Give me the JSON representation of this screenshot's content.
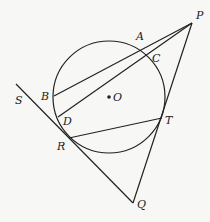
{
  "figure": {
    "circle": {
      "center": "O",
      "cx": 109,
      "cy": 97,
      "r": 56
    },
    "points": {
      "P": {
        "label": "P",
        "x": 192,
        "y": 23,
        "lx": 196,
        "ly": 19
      },
      "A": {
        "label": "A",
        "x": 140,
        "y": 46,
        "lx": 136,
        "ly": 40
      },
      "C": {
        "label": "C",
        "x": 148,
        "y": 55,
        "lx": 152,
        "ly": 62
      },
      "B": {
        "label": "B",
        "x": 54,
        "y": 96,
        "lx": 41,
        "ly": 100
      },
      "D": {
        "label": "D",
        "x": 58,
        "y": 117,
        "lx": 63,
        "ly": 125
      },
      "O": {
        "label": "O",
        "x": 109,
        "y": 97,
        "lx": 113,
        "ly": 101
      },
      "R": {
        "label": "R",
        "x": 69,
        "y": 138,
        "lx": 57,
        "ly": 150
      },
      "T": {
        "label": "T",
        "x": 162,
        "y": 118,
        "lx": 165,
        "ly": 124
      },
      "Q": {
        "label": "Q",
        "x": 133,
        "y": 203,
        "lx": 137,
        "ly": 208
      },
      "S": {
        "label": "S",
        "x": 16,
        "y": 84,
        "lx": 15,
        "ly": 104
      }
    },
    "segments": [
      {
        "from": "P",
        "to": "B",
        "name": "secant-PAB"
      },
      {
        "from": "P",
        "to": "D",
        "name": "secant-PCD"
      },
      {
        "from": "P",
        "to": "Q",
        "name": "tangent-PT-Q"
      },
      {
        "from": "S",
        "to": "Q",
        "name": "tangent-SRQ"
      },
      {
        "from": "R",
        "to": "T",
        "name": "chord-RT"
      }
    ]
  }
}
